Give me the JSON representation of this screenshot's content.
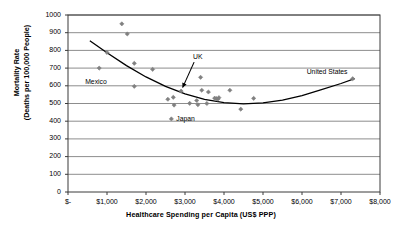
{
  "chart_data": {
    "type": "scatter",
    "title": "",
    "xlabel": "Healthcare Spending per Capita (US$ PPP)",
    "ylabel": "Mortality Rate (Deaths per 100,000 People)",
    "ylabel_line1": "Mortality Rate",
    "ylabel_line2": "(Deaths per 100,000 People)",
    "xlim": [
      0,
      8000
    ],
    "ylim": [
      0,
      1000
    ],
    "grid": "horizontal",
    "legend": "none",
    "xticks": [
      0,
      1000,
      2000,
      3000,
      4000,
      5000,
      6000,
      7000,
      8000
    ],
    "xtick_labels": [
      "$-",
      "$1,000",
      "$2,000",
      "$3,000",
      "$4,000",
      "$5,000",
      "$6,000",
      "$7,000",
      "$8,000"
    ],
    "yticks": [
      0,
      100,
      200,
      300,
      400,
      500,
      600,
      700,
      800,
      900,
      1000
    ],
    "ytick_labels": [
      "0",
      "100",
      "200",
      "300",
      "400",
      "500",
      "600",
      "700",
      "800",
      "900",
      "1000"
    ],
    "marker_color": "#808080",
    "marker_shape": "diamond",
    "trendline_color": "#000000",
    "points": [
      {
        "x": 800,
        "y": 700
      },
      {
        "x": 1000,
        "y": 788
      },
      {
        "x": 1380,
        "y": 950
      },
      {
        "x": 1520,
        "y": 893
      },
      {
        "x": 1700,
        "y": 727
      },
      {
        "x": 1700,
        "y": 597
      },
      {
        "x": 2170,
        "y": 693
      },
      {
        "x": 2560,
        "y": 524
      },
      {
        "x": 2650,
        "y": 413
      },
      {
        "x": 2700,
        "y": 535
      },
      {
        "x": 2720,
        "y": 491
      },
      {
        "x": 2900,
        "y": 570
      },
      {
        "x": 3120,
        "y": 501
      },
      {
        "x": 3300,
        "y": 517
      },
      {
        "x": 3330,
        "y": 493
      },
      {
        "x": 3400,
        "y": 648
      },
      {
        "x": 3430,
        "y": 575
      },
      {
        "x": 3560,
        "y": 500
      },
      {
        "x": 3600,
        "y": 565
      },
      {
        "x": 3760,
        "y": 530
      },
      {
        "x": 3800,
        "y": 528
      },
      {
        "x": 3840,
        "y": 524
      },
      {
        "x": 3870,
        "y": 533
      },
      {
        "x": 4150,
        "y": 575
      },
      {
        "x": 4430,
        "y": 468
      },
      {
        "x": 4760,
        "y": 529
      },
      {
        "x": 7300,
        "y": 640
      }
    ],
    "trendline": [
      {
        "x": 560,
        "y": 855
      },
      {
        "x": 1000,
        "y": 787
      },
      {
        "x": 1500,
        "y": 714
      },
      {
        "x": 2000,
        "y": 650
      },
      {
        "x": 2500,
        "y": 597
      },
      {
        "x": 3000,
        "y": 554
      },
      {
        "x": 3500,
        "y": 523
      },
      {
        "x": 4000,
        "y": 505
      },
      {
        "x": 4500,
        "y": 498
      },
      {
        "x": 5000,
        "y": 503
      },
      {
        "x": 5500,
        "y": 519
      },
      {
        "x": 6000,
        "y": 545
      },
      {
        "x": 6500,
        "y": 578
      },
      {
        "x": 7000,
        "y": 613
      },
      {
        "x": 7350,
        "y": 640
      }
    ],
    "annotations": [
      {
        "label": "Mexico",
        "point_x": 800,
        "point_y": 700,
        "has_arrow": false
      },
      {
        "label": "UK",
        "point_x": 2900,
        "point_y": 570,
        "has_arrow": true
      },
      {
        "label": "Japan",
        "point_x": 2650,
        "point_y": 413,
        "has_arrow": false
      },
      {
        "label": "United States",
        "point_x": 7300,
        "point_y": 640,
        "has_arrow": false
      }
    ]
  }
}
